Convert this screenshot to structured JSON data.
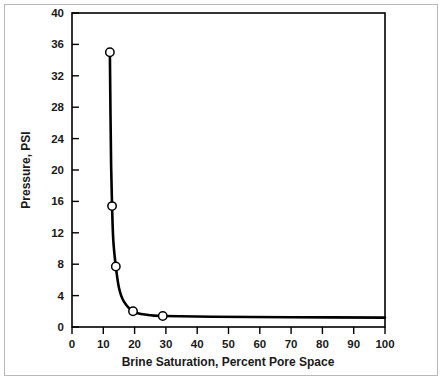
{
  "figure": {
    "background_color": "#ffffff",
    "frame_color": "#b9b9b9",
    "axis_color": "#000000",
    "curve_color": "#000000",
    "marker_fill": "#ffffff"
  },
  "chart_data": {
    "type": "line",
    "title": "",
    "subtitle": "",
    "xlabel": "Brine Saturation, Percent Pore Space",
    "ylabel": "Pressure, PSI",
    "xlim": [
      0,
      100
    ],
    "ylim": [
      0,
      40
    ],
    "xticks": [
      0,
      10,
      20,
      30,
      40,
      50,
      60,
      70,
      80,
      90,
      100
    ],
    "yticks": [
      0,
      4,
      8,
      12,
      16,
      20,
      24,
      28,
      32,
      36,
      40
    ],
    "xtick_labels": [
      "0",
      "10",
      "20",
      "30",
      "40",
      "50",
      "60",
      "70",
      "80",
      "90",
      "100"
    ],
    "ytick_labels": [
      "0",
      "4",
      "8",
      "12",
      "16",
      "20",
      "24",
      "28",
      "32",
      "36",
      "40"
    ],
    "grid": false,
    "legend": null,
    "legend_position": "none",
    "series": [
      {
        "name": "Capillary pressure curve",
        "marker": "open-circle",
        "line_style": "solid",
        "points": [
          {
            "x": 12.1,
            "y": 35.0
          },
          {
            "x": 12.8,
            "y": 15.4
          },
          {
            "x": 14.0,
            "y": 7.7
          },
          {
            "x": 19.5,
            "y": 2.0
          },
          {
            "x": 29.0,
            "y": 1.4
          }
        ],
        "curve_path": [
          {
            "x": 12.1,
            "y": 35.0
          },
          {
            "x": 12.3,
            "y": 27.0
          },
          {
            "x": 12.5,
            "y": 20.5
          },
          {
            "x": 12.8,
            "y": 15.4
          },
          {
            "x": 13.2,
            "y": 11.0
          },
          {
            "x": 14.0,
            "y": 7.7
          },
          {
            "x": 15.0,
            "y": 5.0
          },
          {
            "x": 16.5,
            "y": 3.3
          },
          {
            "x": 19.5,
            "y": 2.0
          },
          {
            "x": 24.0,
            "y": 1.55
          },
          {
            "x": 29.0,
            "y": 1.4
          },
          {
            "x": 45.0,
            "y": 1.3
          },
          {
            "x": 70.0,
            "y": 1.25
          },
          {
            "x": 100.0,
            "y": 1.2
          }
        ]
      }
    ],
    "annotations": []
  }
}
